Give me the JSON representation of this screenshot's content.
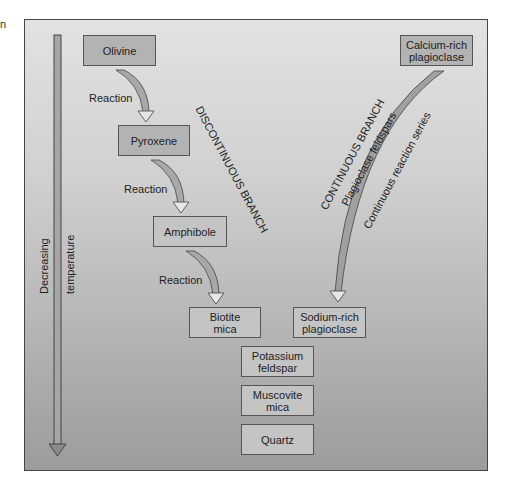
{
  "edge_fragment": "n",
  "temperature_axis": {
    "label_left": "Decreasing",
    "label_right": "temperature"
  },
  "discontinuous_branch": {
    "title": "DISCONTINUOUS BRANCH",
    "minerals": [
      {
        "name": "Olivine"
      },
      {
        "name": "Pyroxene"
      },
      {
        "name": "Amphibole"
      },
      {
        "name_line1": "Biotite",
        "name_line2": "mica"
      }
    ],
    "reaction_labels": [
      "Reaction",
      "Reaction",
      "Reaction"
    ]
  },
  "continuous_branch": {
    "title": "CONTINUOUS BRANCH",
    "subtitle": "Plagioclase feldspars",
    "series_label": "Continuous reaction series",
    "start": {
      "line1": "Calcium-rich",
      "line2": "plagioclase"
    },
    "end": {
      "line1": "Sodium-rich",
      "line2": "plagioclase"
    }
  },
  "final_sequence": [
    {
      "line1": "Potassium",
      "line2": "feldspar"
    },
    {
      "line1": "Muscovite",
      "line2": "mica"
    },
    {
      "line1": "Quartz"
    }
  ],
  "colors": {
    "panel_top": "#e2e2e2",
    "panel_bottom": "#9c9c9c",
    "box_fill": "#b3b3b3",
    "arrow_fill": "#a0a0a0",
    "stroke": "#444444"
  }
}
